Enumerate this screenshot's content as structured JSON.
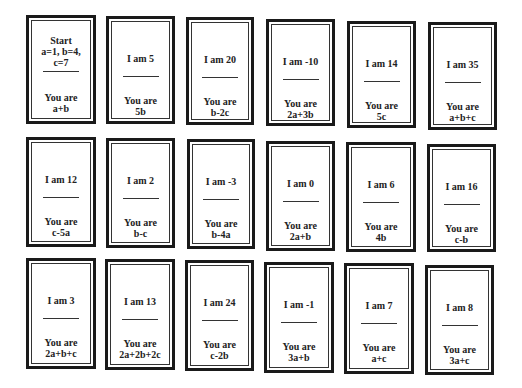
{
  "cards": [
    {
      "top_lines": [
        "Start",
        "a=1, b=4,",
        "c=7"
      ],
      "label": "You are",
      "expr": "a+b"
    },
    {
      "top_lines": [
        "I am 5"
      ],
      "label": "You are",
      "expr": "5b"
    },
    {
      "top_lines": [
        "I am 20"
      ],
      "label": "You are",
      "expr": "b-2c"
    },
    {
      "top_lines": [
        "I am -10"
      ],
      "label": "You are",
      "expr": "2a+3b"
    },
    {
      "top_lines": [
        "I am 14"
      ],
      "label": "You are",
      "expr": "5c"
    },
    {
      "top_lines": [
        "I am 35"
      ],
      "label": "You are",
      "expr": "a+b+c"
    },
    {
      "top_lines": [
        "I am 12"
      ],
      "label": "You are",
      "expr": "c-5a"
    },
    {
      "top_lines": [
        "I am 2"
      ],
      "label": "You are",
      "expr": "b-c"
    },
    {
      "top_lines": [
        "I am -3"
      ],
      "label": "You are",
      "expr": "b-4a"
    },
    {
      "top_lines": [
        "I am 0"
      ],
      "label": "You are",
      "expr": "2a+b"
    },
    {
      "top_lines": [
        "I am 6"
      ],
      "label": "You are",
      "expr": "4b"
    },
    {
      "top_lines": [
        "I am 16"
      ],
      "label": "You are",
      "expr": "c-b"
    },
    {
      "top_lines": [
        "I am 3"
      ],
      "label": "You are",
      "expr": "2a+b+c"
    },
    {
      "top_lines": [
        "I am 13"
      ],
      "label": "You are",
      "expr": "2a+2b+2c"
    },
    {
      "top_lines": [
        "I am 24"
      ],
      "label": "You are",
      "expr": "c-2b"
    },
    {
      "top_lines": [
        "I am -1"
      ],
      "label": "You are",
      "expr": "3a+b"
    },
    {
      "top_lines": [
        "I am 7"
      ],
      "label": "You are",
      "expr": "a+c"
    },
    {
      "top_lines": [
        "I am 8"
      ],
      "label": "You are",
      "expr": "3a+c"
    }
  ]
}
